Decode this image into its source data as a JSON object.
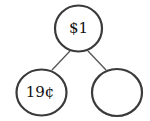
{
  "diagram": {
    "type": "number-bond",
    "whole": {
      "label": "$1"
    },
    "parts": [
      {
        "label": "19¢"
      },
      {
        "label": ""
      }
    ],
    "colors": {
      "stroke": "#3a3a3a",
      "line": "#555555",
      "text": "#111111",
      "background": "#ffffff"
    }
  }
}
